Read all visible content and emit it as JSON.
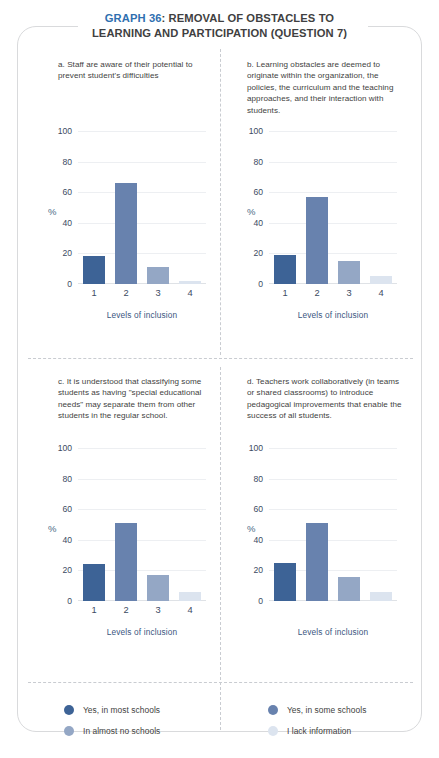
{
  "title": {
    "accent": "GRAPH 36",
    "rest": ": REMOVAL OF OBSTACLES TO",
    "line2": "LEARNING AND PARTICIPATION (QUESTION 7)",
    "accent_color": "#2f6fb0",
    "text_color": "#3f3f41"
  },
  "legend": {
    "items": [
      {
        "label": "Yes, in most schools",
        "color": "#3d6396"
      },
      {
        "label": "Yes, in some schools",
        "color": "#6882ae"
      },
      {
        "label": "In almost no schools",
        "color": "#94a7c5"
      },
      {
        "label": "I lack information",
        "color": "#dce4ef"
      }
    ]
  },
  "common": {
    "ylabel": "%",
    "xlabel": "Levels of inclusion",
    "yticks": [
      0,
      20,
      40,
      60,
      80,
      100
    ],
    "xticks": [
      "1",
      "2",
      "3",
      "4"
    ],
    "bar_colors": [
      "#3d6396",
      "#6882ae",
      "#94a7c5",
      "#dce4ef"
    ]
  },
  "chart_data": [
    {
      "id": "a",
      "type": "bar",
      "title": "a. Staff are aware of their potential to prevent student's difficulties",
      "categories": [
        "1",
        "2",
        "3",
        "4"
      ],
      "values": [
        18,
        66,
        11,
        2
      ],
      "xlabel": "Levels of inclusion",
      "ylabel": "%",
      "ylim": [
        0,
        100
      ],
      "yticks": [
        0,
        20,
        40,
        60,
        80,
        100
      ],
      "show_xticks": true,
      "grid": true,
      "legend": "bottom"
    },
    {
      "id": "b",
      "type": "bar",
      "title": "b. Learning obstacles are deemed to originate within the organization, the policies, the curriculum and the teaching approaches, and their interaction with students.",
      "categories": [
        "1",
        "2",
        "3",
        "4"
      ],
      "values": [
        19,
        57,
        15,
        5
      ],
      "xlabel": "Levels of inclusion",
      "ylabel": "%",
      "ylim": [
        0,
        100
      ],
      "yticks": [
        0,
        20,
        40,
        60,
        80,
        100
      ],
      "show_xticks": true,
      "grid": true,
      "legend": "bottom"
    },
    {
      "id": "c",
      "type": "bar",
      "title": "c. It is understood that classifying some students as having \"special educational needs\" may separate them from other students in the regular school.",
      "categories": [
        "1",
        "2",
        "3",
        "4"
      ],
      "values": [
        24,
        51,
        17,
        6
      ],
      "xlabel": "Levels of inclusion",
      "ylabel": "%",
      "ylim": [
        0,
        100
      ],
      "yticks": [
        0,
        20,
        40,
        60,
        80,
        100
      ],
      "show_xticks": true,
      "grid": true,
      "legend": "bottom"
    },
    {
      "id": "d",
      "type": "bar",
      "title": "d. Teachers work collaboratively (in teams or shared classrooms) to introduce pedagogical improvements that enable the success of all students.",
      "categories": [
        "1",
        "2",
        "3",
        "4"
      ],
      "values": [
        25,
        51,
        16,
        6
      ],
      "xlabel": "Levels of inclusion",
      "ylabel": "%",
      "ylim": [
        0,
        100
      ],
      "yticks": [
        0,
        20,
        40,
        60,
        80,
        100
      ],
      "show_xticks": false,
      "grid": true,
      "legend": "bottom"
    }
  ]
}
